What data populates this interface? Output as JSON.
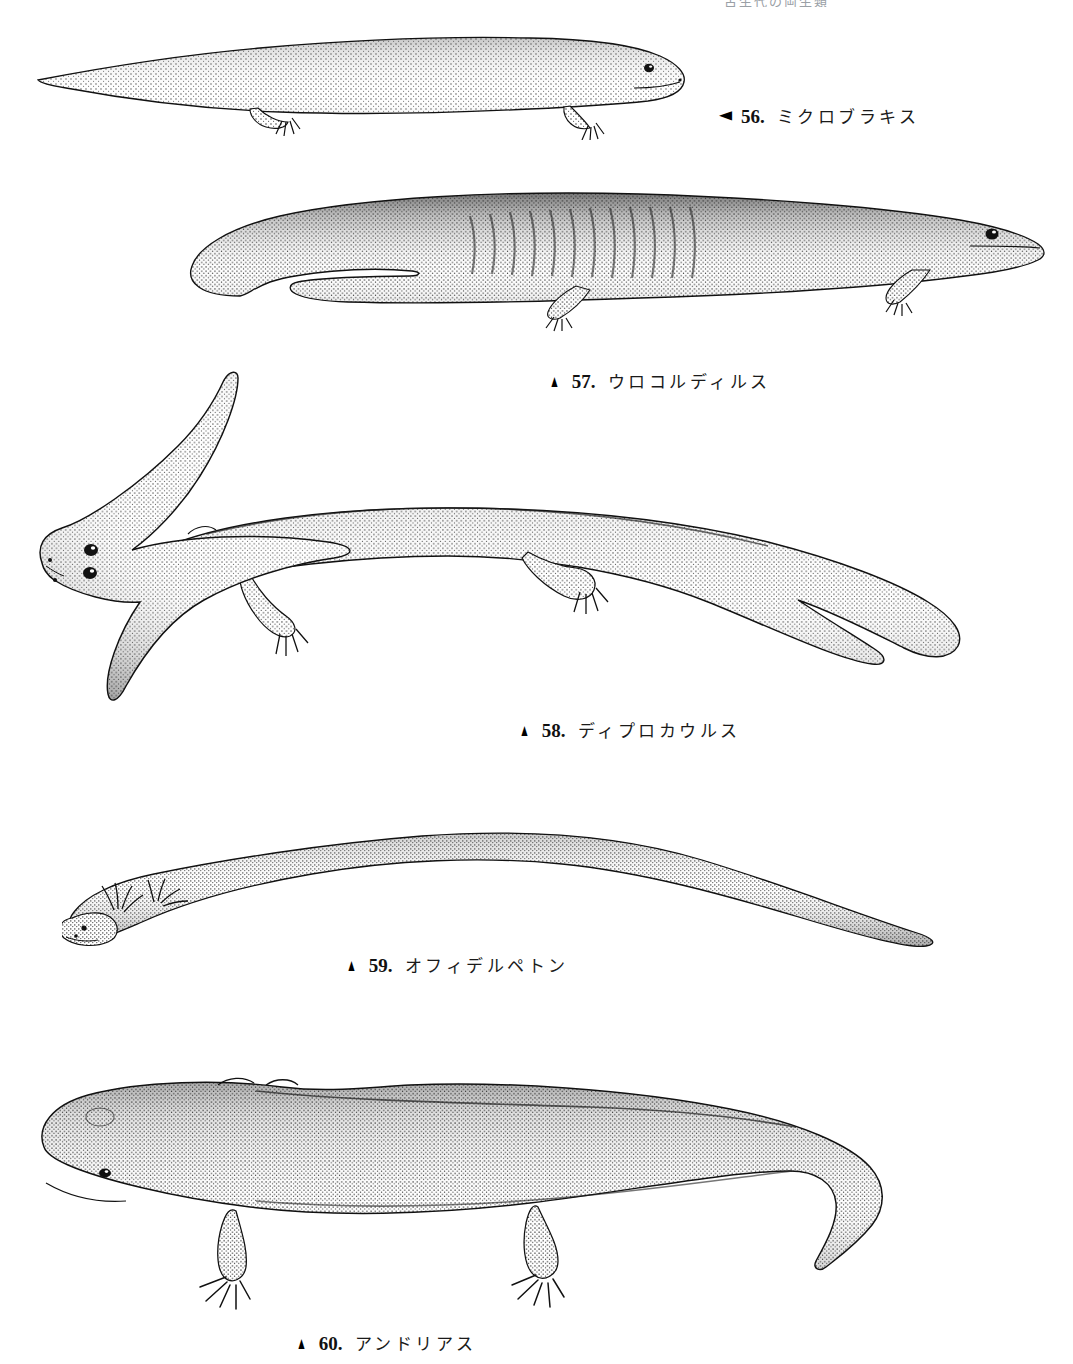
{
  "page": {
    "width": 1073,
    "height": 1364,
    "background": "#ffffff",
    "ink": "#111111",
    "running_head": "古生代の両生類"
  },
  "figures": [
    {
      "number": "56.",
      "name": "ミクロブラキス",
      "marker": "◀",
      "marker_type": "left",
      "caption_left": 719,
      "caption_top": 103,
      "art_left": 30,
      "art_top": 18,
      "art_width": 690,
      "art_height": 122,
      "kind": "microbrachis"
    },
    {
      "number": "57.",
      "name": "ウロコルディルス",
      "marker": "▲",
      "marker_type": "up",
      "caption_left": 546,
      "caption_top": 368,
      "art_left": 170,
      "art_top": 178,
      "art_width": 880,
      "art_height": 172,
      "kind": "urocordylus"
    },
    {
      "number": "58.",
      "name": "ディプロカウルス",
      "marker": "▲",
      "marker_type": "up",
      "caption_left": 516,
      "caption_top": 717,
      "art_left": 28,
      "art_top": 368,
      "art_width": 955,
      "art_height": 370,
      "kind": "diplocaulus"
    },
    {
      "number": "59.",
      "name": "オフィデルペトン",
      "marker": "▲",
      "marker_type": "up",
      "caption_left": 343,
      "caption_top": 952,
      "art_left": 62,
      "art_top": 800,
      "art_width": 890,
      "art_height": 152,
      "kind": "ophiderpeton"
    },
    {
      "number": "60.",
      "name": "アンドリアス",
      "marker": "▲",
      "marker_type": "up",
      "caption_left": 293,
      "caption_top": 1330,
      "art_left": 30,
      "art_top": 1055,
      "art_width": 900,
      "art_height": 270,
      "kind": "andrias"
    }
  ]
}
